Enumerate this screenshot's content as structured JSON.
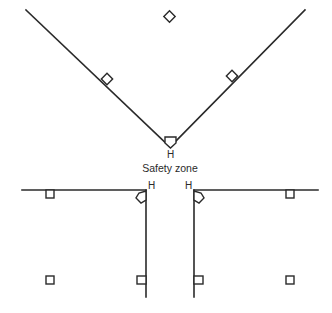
{
  "diagram": {
    "colors": {
      "ink": "#2a2a2a",
      "background": "#ffffff"
    },
    "caption": "Safety zone",
    "upper_field": {
      "home_label": "H",
      "bases": [
        "second-base",
        "first-base",
        "third-base",
        "home-plate"
      ]
    },
    "lower_left_field": {
      "home_label": "H",
      "bases": [
        "home-plate",
        "base-1",
        "base-2",
        "base-3"
      ]
    },
    "lower_right_field": {
      "home_label": "H",
      "bases": [
        "home-plate",
        "base-1",
        "base-2",
        "base-3"
      ]
    }
  }
}
